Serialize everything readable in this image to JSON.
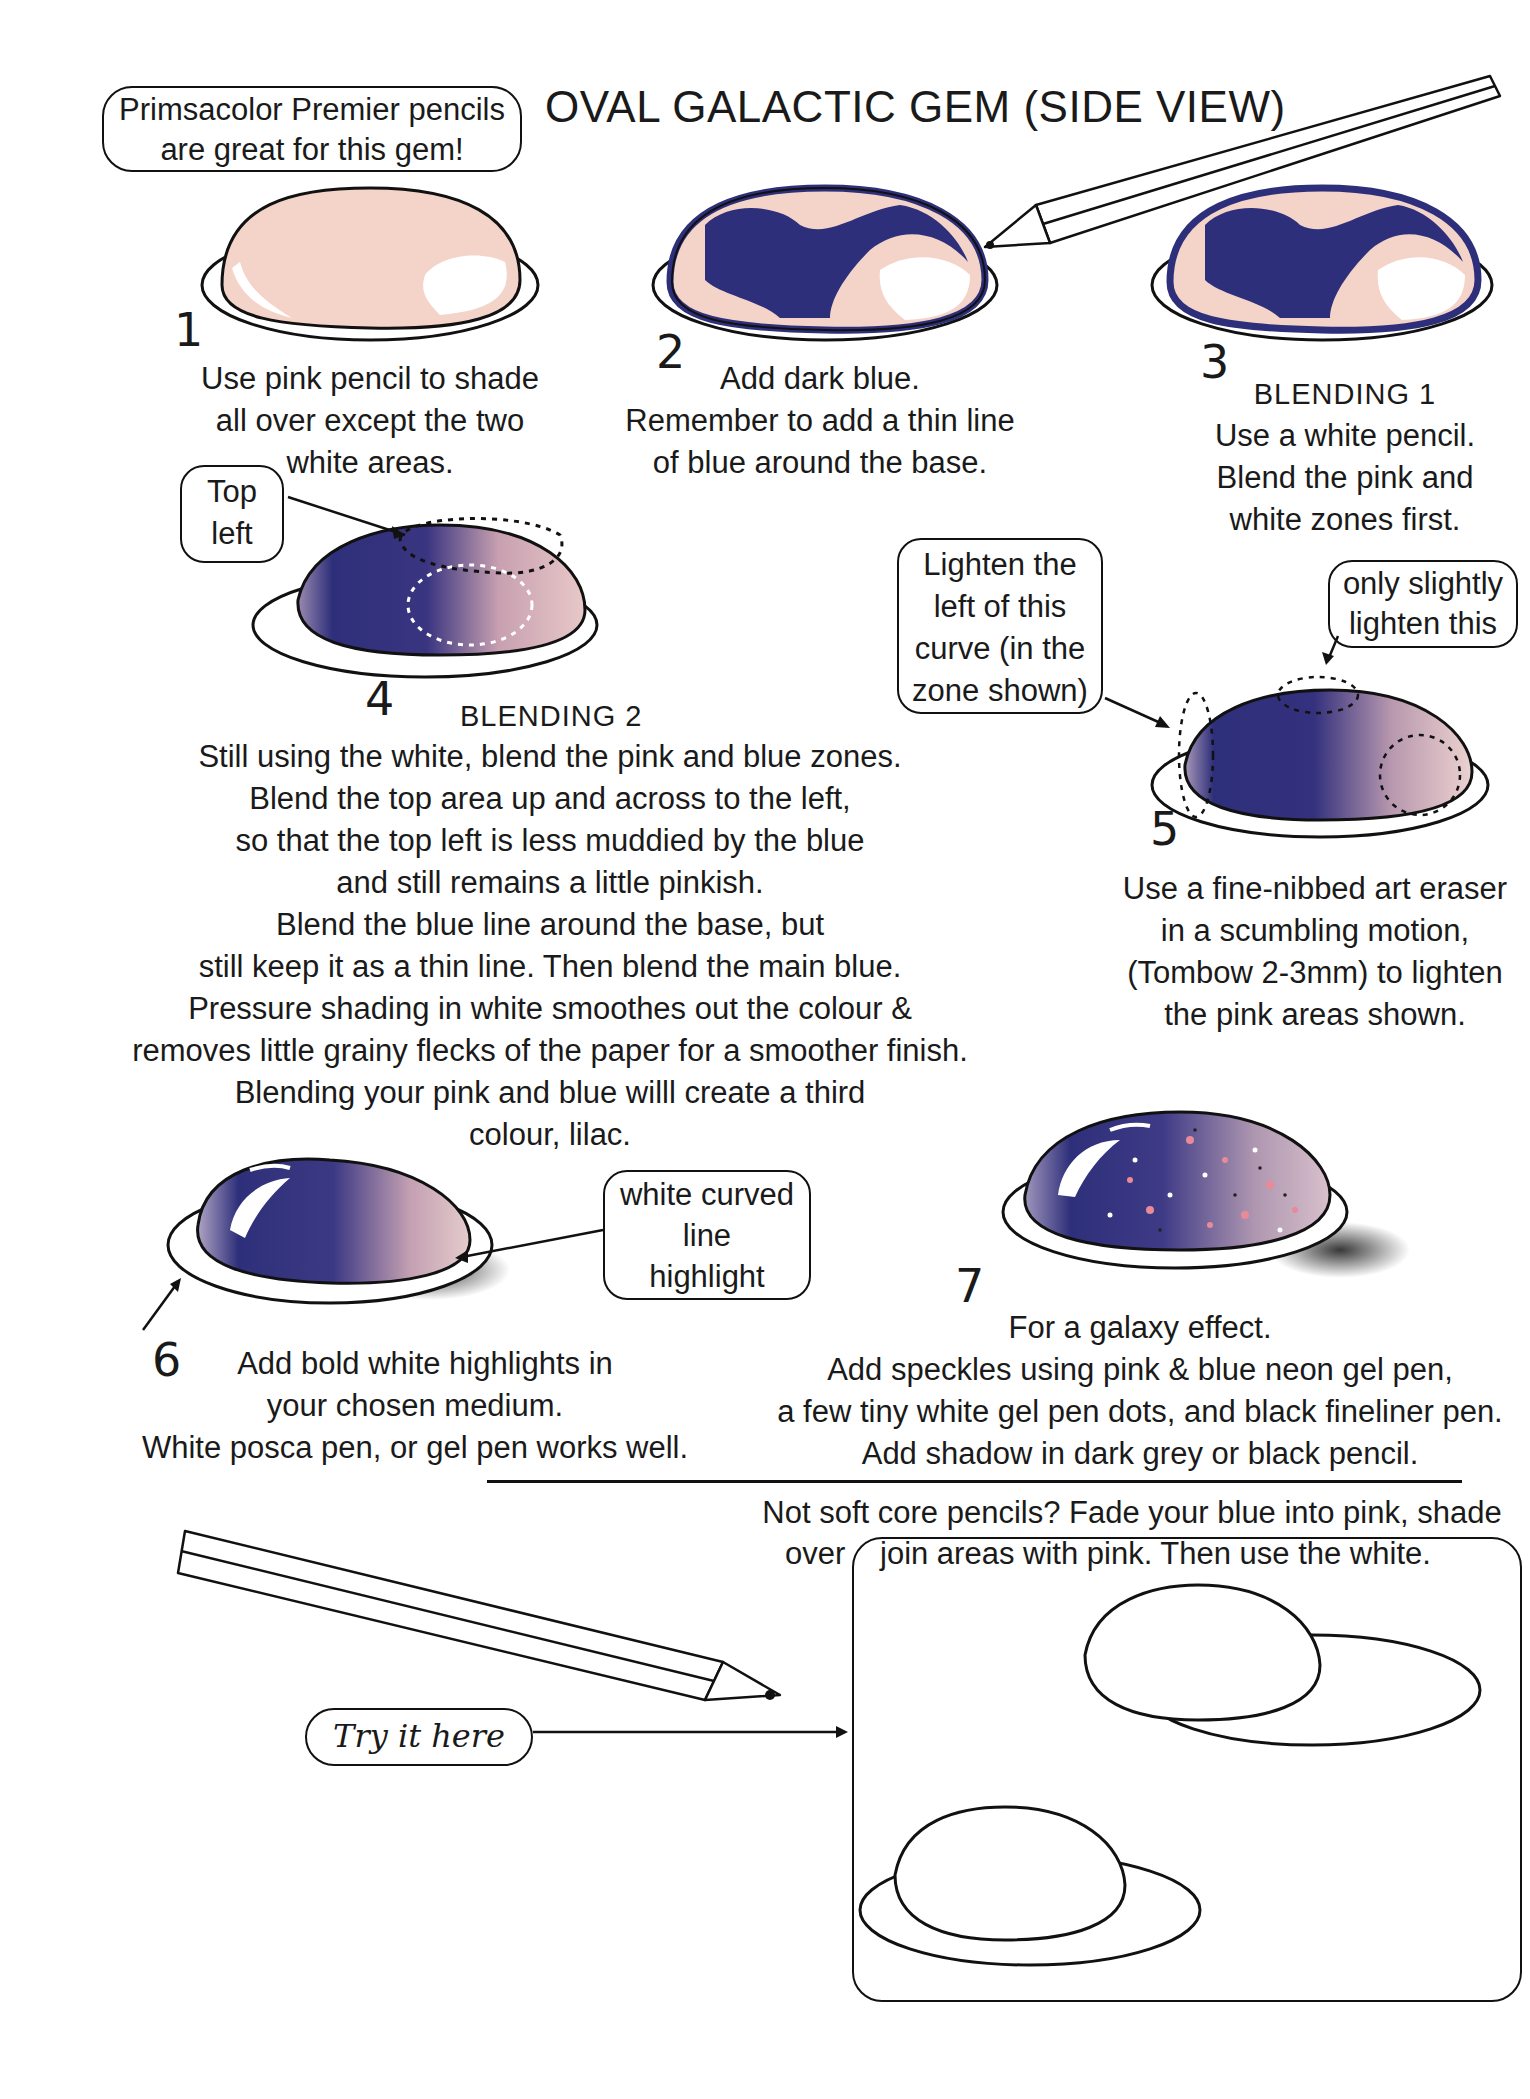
{
  "header": {
    "title": "OVAL GALACTIC GEM (SIDE VIEW)",
    "tip_callout": [
      "Primsacolor Premier pencils",
      "are great for this gem!"
    ]
  },
  "colors": {
    "pink": "#f4d3c9",
    "dark_blue": "#2e2f7a",
    "lilac": "#8c7aa6",
    "outline": "#111111"
  },
  "steps": [
    {
      "number": "1",
      "heading": "",
      "lines": [
        "Use pink pencil to shade",
        "all over except the two",
        "white areas."
      ]
    },
    {
      "number": "2",
      "heading": "",
      "lines": [
        "Add dark blue.",
        "Remember to add a thin line",
        "of blue around the base."
      ]
    },
    {
      "number": "3",
      "heading": "BLENDING 1",
      "lines": [
        "Use a white pencil.",
        "Blend the pink and",
        "white zones first."
      ]
    },
    {
      "number": "4",
      "heading": "BLENDING 2",
      "callout": [
        "Top",
        "left"
      ],
      "lines": [
        "Still using the white, blend the pink and blue zones.",
        "Blend the top area up and across to the left,",
        "so that the top left is less muddied by the blue",
        "and still remains a little pinkish.",
        "Blend the blue line around the base, but",
        "still keep it as a thin line.  Then blend the main blue.",
        "Pressure shading in white smoothes out the colour &",
        "removes little grainy flecks of the paper for a smoother finish.",
        "Blending your pink and blue willl create a third",
        "colour, lilac."
      ]
    },
    {
      "number": "5",
      "heading": "",
      "callout_left": [
        "Lighten the",
        "left of this",
        "curve (in the",
        "zone shown)"
      ],
      "callout_right": [
        "only slightly",
        "lighten this"
      ],
      "lines": [
        "Use a fine-nibbed art eraser",
        "in a scumbling motion,",
        "(Tombow 2-3mm) to lighten",
        "the pink areas shown."
      ]
    },
    {
      "number": "6",
      "heading": "",
      "callout": [
        "white curved",
        "line",
        "highlight"
      ],
      "lines": [
        "Add bold white highlights in",
        "your chosen medium.",
        "White posca pen, or gel pen works well."
      ]
    },
    {
      "number": "7",
      "heading": "",
      "lines": [
        "For a galaxy effect.",
        "Add speckles using pink & blue neon gel pen,",
        "a few tiny white gel pen dots, and black fineliner pen.",
        "Add shadow in dark grey or black pencil."
      ]
    }
  ],
  "footer": {
    "note_line1": "Not soft core pencils? Fade your blue into pink, shade",
    "note_line2_prefix": "over",
    "note_line2": "join areas with pink. Then use the white.",
    "try_label": "Try it here"
  }
}
